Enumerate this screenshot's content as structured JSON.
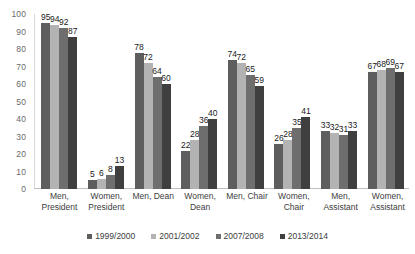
{
  "chart_data": {
    "type": "bar",
    "title": "",
    "subtitle": "",
    "xlabel": "",
    "ylabel": "",
    "ylim": [
      0,
      100
    ],
    "ytick_step": 10,
    "yticks": [
      100,
      90,
      80,
      70,
      60,
      50,
      40,
      30,
      20,
      10,
      0
    ],
    "grid": false,
    "legend_position": "bottom",
    "data_labels": true,
    "categories": [
      "Men, President",
      "Women, President",
      "Men, Dean",
      "Women, Dean",
      "Men, Chair",
      "Women, Chair",
      "Men, Assistant",
      "Women, Assistant"
    ],
    "series": [
      {
        "name": "1999/2000",
        "color": "#5e5e5e",
        "values": [
          95,
          5,
          78,
          22,
          74,
          26,
          33,
          67
        ]
      },
      {
        "name": "2001/2002",
        "color": "#b3b3b3",
        "values": [
          94,
          6,
          72,
          28,
          72,
          28,
          32,
          68
        ]
      },
      {
        "name": "2007/2008",
        "color": "#6e6e6e",
        "values": [
          92,
          8,
          64,
          36,
          65,
          35,
          31,
          69
        ]
      },
      {
        "name": "2013/2014",
        "color": "#3f3f3f",
        "values": [
          87,
          13,
          60,
          40,
          59,
          41,
          33,
          67
        ]
      }
    ]
  },
  "axis": {
    "y_tick_labels": [
      "100",
      "90",
      "80",
      "70",
      "60",
      "50",
      "40",
      "30",
      "20",
      "10",
      "0"
    ],
    "x_category_labels": [
      "Men, President",
      "Women, President",
      "Men, Dean",
      "Women, Dean",
      "Men, Chair",
      "Women, Chair",
      "Men, Assistant",
      "Women, Assistant"
    ]
  },
  "legend": {
    "items": [
      {
        "label": "1999/2000",
        "color": "#5e5e5e"
      },
      {
        "label": "2001/2002",
        "color": "#b3b3b3"
      },
      {
        "label": "2007/2008",
        "color": "#6e6e6e"
      },
      {
        "label": "2013/2014",
        "color": "#3f3f3f"
      }
    ]
  }
}
